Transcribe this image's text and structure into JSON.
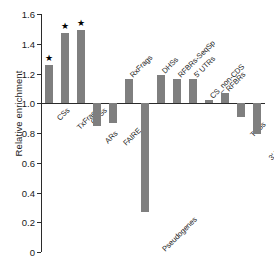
{
  "top_strip_text": "",
  "chart_data": {
    "type": "bar",
    "title": "",
    "xlabel": "",
    "ylabel": "Relative enrichment",
    "ylim": [
      0,
      1.6
    ],
    "yticks": [
      "0",
      "0.2",
      "0.4",
      "0.6",
      "0.8",
      "1.0",
      "1.2",
      "1.4",
      "1.6"
    ],
    "ytick_values": [
      0,
      0.2,
      0.4,
      0.6,
      0.8,
      1.0,
      1.2,
      1.4,
      1.6
    ],
    "baseline": 1.0,
    "grid": false,
    "legend": "none",
    "bar_color": "#7f7f7f",
    "axis_color": "#2b2b2b",
    "significance_marker": "★",
    "categories": [
      "CSs",
      "TxFrags",
      "CDSs",
      "ARs",
      "FAIRE",
      "RxFrags",
      "Pseudogenes",
      "DHSs",
      "RFBRs-SeqSp",
      "5' UTRs",
      "CS_non-CDS",
      "RFBRs",
      "TSSs",
      "3' UTRs"
    ],
    "values": [
      1.26,
      1.47,
      1.49,
      0.85,
      0.87,
      1.16,
      0.27,
      1.19,
      1.16,
      1.16,
      1.02,
      1.07,
      0.91,
      0.79
    ],
    "significant": [
      true,
      true,
      true,
      false,
      false,
      false,
      false,
      false,
      false,
      false,
      false,
      false,
      false,
      false
    ],
    "label_position": [
      "below",
      "below",
      "below",
      "below",
      "below",
      "above",
      "below",
      "above",
      "above",
      "above",
      "above",
      "above",
      "below",
      "below"
    ]
  }
}
